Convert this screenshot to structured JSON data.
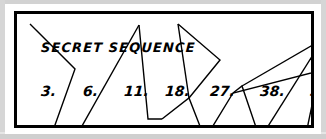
{
  "page": {
    "background": "#ffffff",
    "paper_edge_color": "#d2d2d2",
    "card_background": "#ffffff",
    "frame_color": "#000000",
    "ink_color": "#000000"
  },
  "card": {
    "title": "SECRET SEQUENCE"
  },
  "sequence": {
    "label": "SECRET SEQUENCE",
    "items": [
      {
        "text": "3.",
        "value": 3,
        "x": 24
      },
      {
        "text": "6.",
        "value": 6,
        "x": 66
      },
      {
        "text": "11.",
        "value": 11,
        "x": 107
      },
      {
        "text": "18.",
        "value": 18,
        "x": 148
      },
      {
        "text": "27.",
        "value": 27,
        "x": 193
      },
      {
        "text": "38.",
        "value": 38,
        "x": 243
      },
      {
        "text": "51.",
        "value": 51,
        "x": 293
      }
    ]
  },
  "artwork": {
    "description": "cracked-glass straight-line polygon pattern",
    "stroke_color": "#000000",
    "stroke_width": 1.4,
    "paths": [
      "M 13 10 L 58 55 L 33 125",
      "M 68 125 L 65 112 L 80 117 L 105 125",
      "M 65 112 L 122 11",
      "M 122 11 L 131 105 L 145 105",
      "M 145 105 L 172 84 L 188 125",
      "M 172 84 L 161 10",
      "M 161 10 L 203 46 L 172 84",
      "M 188 125 L 216 79 L 302 57",
      "M 216 79 L 225 72 L 243 125",
      "M 225 72 L 306 25",
      "M 306 25 L 243 125",
      "M 302 57 L 302 125",
      "M 288 125 L 302 57"
    ]
  }
}
